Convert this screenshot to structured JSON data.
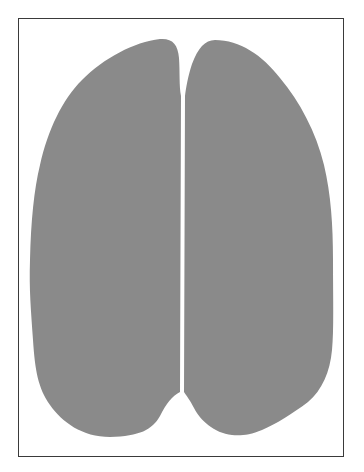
{
  "figure": {
    "colors": {
      "background": "#ffffff",
      "frame": "#3a3a3a",
      "fill": "#8a8a8a"
    },
    "lobes": [
      {
        "name": "left-lobe"
      },
      {
        "name": "right-lobe"
      }
    ]
  }
}
